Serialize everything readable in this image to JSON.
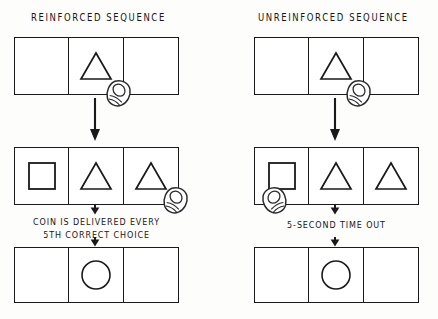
{
  "figure": {
    "width": 438,
    "height": 319,
    "background_color": "#fdfdfc",
    "ink_color": "#1a1a1c"
  },
  "columns": [
    {
      "id": "reinforced",
      "title": "REINFORCED  SEQUENCE",
      "rows": [
        {
          "id": "reinforced-row-1",
          "cells": [
            {
              "shape": "blank"
            },
            {
              "shape": "triangle"
            },
            {
              "shape": "blank"
            }
          ],
          "hand": {
            "present": true,
            "cell_index": 1,
            "facing": "right"
          }
        },
        {
          "id": "reinforced-row-2",
          "cells": [
            {
              "shape": "square"
            },
            {
              "shape": "triangle"
            },
            {
              "shape": "triangle"
            }
          ],
          "hand": {
            "present": true,
            "cell_index": 2,
            "facing": "right"
          }
        },
        {
          "id": "reinforced-row-3",
          "cells": [
            {
              "shape": "blank"
            },
            {
              "shape": "circle"
            },
            {
              "shape": "blank"
            }
          ],
          "hand": {
            "present": false,
            "cell_index": null,
            "facing": null
          }
        }
      ],
      "caption": "COIN IS DELIVERED EVERY\n5TH CORRECT CHOICE"
    },
    {
      "id": "unreinforced",
      "title": "UNREINFORCED  SEQUENCE",
      "rows": [
        {
          "id": "unreinforced-row-1",
          "cells": [
            {
              "shape": "blank"
            },
            {
              "shape": "triangle"
            },
            {
              "shape": "blank"
            }
          ],
          "hand": {
            "present": true,
            "cell_index": 1,
            "facing": "right"
          }
        },
        {
          "id": "unreinforced-row-2",
          "cells": [
            {
              "shape": "square"
            },
            {
              "shape": "triangle"
            },
            {
              "shape": "triangle"
            }
          ],
          "hand": {
            "present": true,
            "cell_index": 0,
            "facing": "left"
          }
        },
        {
          "id": "unreinforced-row-3",
          "cells": [
            {
              "shape": "blank"
            },
            {
              "shape": "circle"
            },
            {
              "shape": "blank"
            }
          ],
          "hand": {
            "present": false,
            "cell_index": null,
            "facing": null
          }
        }
      ],
      "caption": "5-SECOND TIME OUT"
    }
  ],
  "icons": {
    "triangle": "triangle-shape-icon",
    "square": "square-shape-icon",
    "circle": "circle-shape-icon",
    "hand": "pointing-hand-icon",
    "arrow": "down-arrow-icon"
  }
}
